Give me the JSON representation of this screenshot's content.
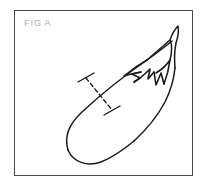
{
  "figure": {
    "label": "FIG A",
    "style": "patent-line-art",
    "frame": {
      "border_color": "#4a4a4a",
      "background_color": "#ffffff",
      "border_width_px": 1,
      "x": 14,
      "y": 10,
      "width": 179,
      "height": 166
    },
    "label_style": {
      "color": "#b0b0b0",
      "font_size_px": 9.5
    },
    "ink_color": "#1a1a1a",
    "parts": [
      {
        "name": "fruit-body",
        "description": "elongated curved eggplant body, bulbous rounded blossom end at lower left tapering toward upper right"
      },
      {
        "name": "calyx",
        "description": "pointed sepal lobes radiating back-left from the stem"
      },
      {
        "name": "stem",
        "description": "narrow tapering peduncle at the upper right tip"
      },
      {
        "name": "measurement-line",
        "description": "dashed line crossing the body with perpendicular tick marks at both ends"
      }
    ],
    "measurement_line": {
      "style": "dashed",
      "dash_pattern": "4 3",
      "end_caps": "perpendicular-tick",
      "start": {
        "x": 86,
        "y": 78
      },
      "end": {
        "x": 112,
        "y": 110
      }
    }
  }
}
